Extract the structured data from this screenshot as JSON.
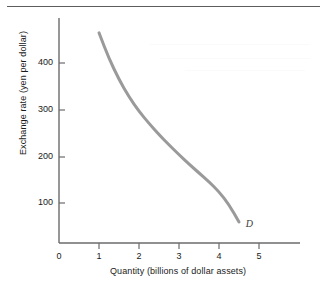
{
  "figure": {
    "background_color": "#ffffff",
    "rule_color": "#5d5d5d",
    "axis_color": "#6b6b6b",
    "curve_color": "#9a9a9a",
    "text_color": "#1a1a1a"
  },
  "chart_data": {
    "type": "line",
    "title": "",
    "subtitle": "",
    "xlabel": "Quantity (billions of dollar assets)",
    "ylabel": "Exchange rate (yen per dollar)",
    "xlim": [
      0,
      6
    ],
    "ylim": [
      0,
      500
    ],
    "xticks": [
      0,
      1,
      2,
      3,
      4,
      5
    ],
    "xtick_labels": [
      "0",
      "1",
      "2",
      "3",
      "4",
      "5"
    ],
    "yticks": [
      100,
      200,
      300,
      400
    ],
    "ytick_labels": [
      "100",
      "200",
      "300",
      "400"
    ],
    "grid": false,
    "legend_position": "inline-annotation",
    "series": [
      {
        "name": "D",
        "label": "D",
        "label_style": "italic",
        "color": "#9a9a9a",
        "line_width": 3,
        "x": [
          1.0,
          1.25,
          1.5,
          1.75,
          2.0,
          2.25,
          2.5,
          2.75,
          3.0,
          3.25,
          3.5,
          3.75,
          4.0,
          4.25,
          4.5
        ],
        "y": [
          450,
          395,
          350,
          313,
          282,
          256,
          232,
          210,
          189,
          169,
          150,
          131,
          110,
          82,
          45
        ]
      }
    ],
    "annotations": [
      {
        "text": "D",
        "x": 4.72,
        "y": 38,
        "style": "italic"
      }
    ]
  }
}
